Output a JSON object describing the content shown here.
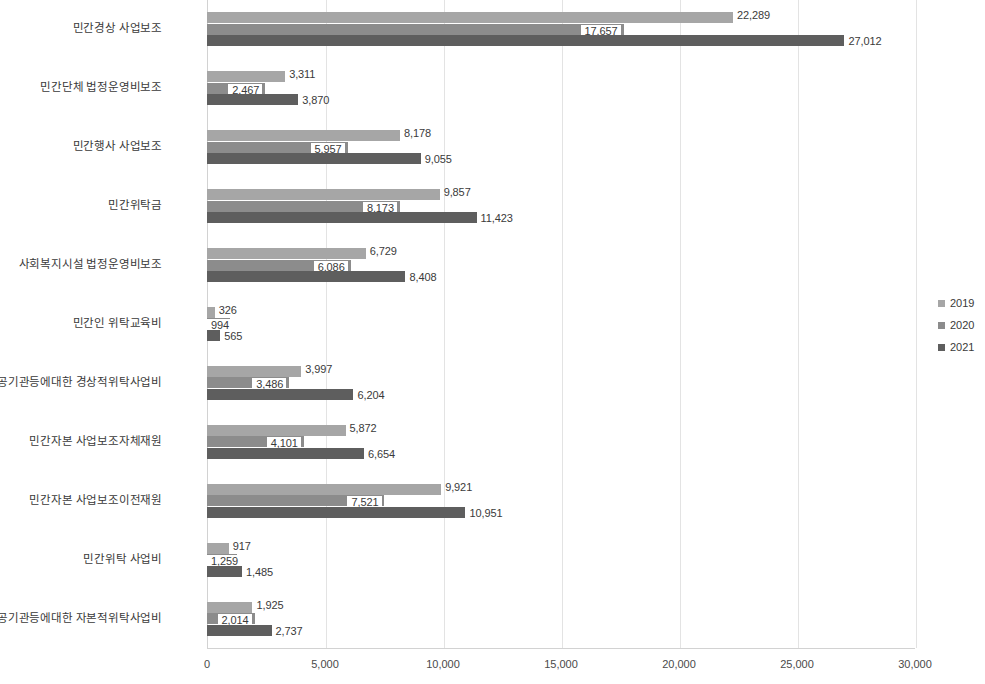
{
  "chart_data": {
    "type": "bar",
    "orientation": "horizontal",
    "title": "",
    "xlabel": "",
    "ylabel": "",
    "xlim": [
      0,
      30000
    ],
    "xticks": [
      "0",
      "5,000",
      "10,000",
      "15,000",
      "20,000",
      "25,000",
      "30,000"
    ],
    "xtick_values": [
      0,
      5000,
      10000,
      15000,
      20000,
      25000,
      30000
    ],
    "grid": true,
    "legend_position": "right",
    "categories": [
      "민간경상 사업보조",
      "민간단체 법정운영비보조",
      "민간행사 사업보조",
      "민간위탁금",
      "사회복지시설 법정운영비보조",
      "민간인 위탁교육비",
      "공기관등에대한 경상적위탁사업비",
      "민간자본 사업보조자체재원",
      "민간자본 사업보조이전재원",
      "민간위탁 사업비",
      "공기관등에대한 자본적위탁사업비"
    ],
    "series": [
      {
        "name": "2019",
        "color": "#a6a6a6",
        "values": [
          22289,
          3311,
          8178,
          9857,
          6729,
          326,
          3997,
          5872,
          9921,
          917,
          1925
        ],
        "labels": [
          "22,289",
          "3,311",
          "8,178",
          "9,857",
          "6,729",
          "326",
          "3,997",
          "5,872",
          "9,921",
          "917",
          "1,925"
        ]
      },
      {
        "name": "2020",
        "color": "#8c8c8c",
        "values": [
          17657,
          2467,
          5957,
          8173,
          6086,
          994,
          3486,
          4101,
          7521,
          1259,
          2014
        ],
        "labels": [
          "17,657",
          "2,467",
          "5,957",
          "8,173",
          "6,086",
          "994",
          "3,486",
          "4,101",
          "7,521",
          "1,259",
          "2,014"
        ]
      },
      {
        "name": "2021",
        "color": "#5e5e5e",
        "values": [
          27012,
          3870,
          9055,
          11423,
          8408,
          565,
          6204,
          6654,
          10951,
          1485,
          2737
        ],
        "labels": [
          "27,012",
          "3,870",
          "9,055",
          "11,423",
          "8,408",
          "565",
          "6,204",
          "6,654",
          "10,951",
          "1,485",
          "2,737"
        ]
      }
    ],
    "legend": [
      "2019",
      "2020",
      "2021"
    ]
  }
}
